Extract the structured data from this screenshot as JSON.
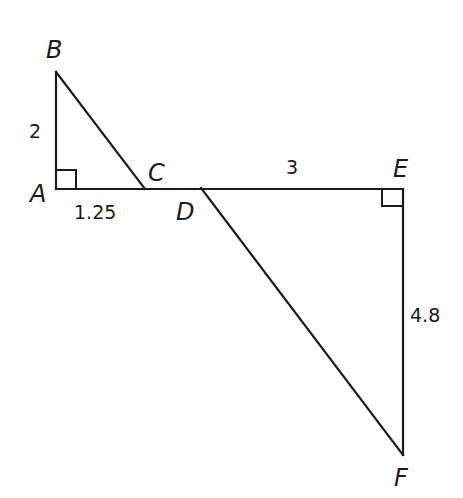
{
  "diagram": {
    "points": {
      "A": {
        "label": "A",
        "x": 56,
        "y": 189
      },
      "B": {
        "label": "B",
        "x": 56,
        "y": 72
      },
      "C": {
        "label": "C",
        "x": 145,
        "y": 189
      },
      "D": {
        "label": "D",
        "x": 201,
        "y": 188
      },
      "E": {
        "label": "E",
        "x": 403,
        "y": 189
      },
      "F": {
        "label": "F",
        "x": 403,
        "y": 455
      }
    },
    "measures": {
      "AB": "2",
      "AC": "1.25",
      "DE": "3",
      "EF": "4.8"
    },
    "right_angles": [
      "A",
      "E"
    ],
    "segments": [
      "AB",
      "BC",
      "AE",
      "DF",
      "EF"
    ]
  }
}
